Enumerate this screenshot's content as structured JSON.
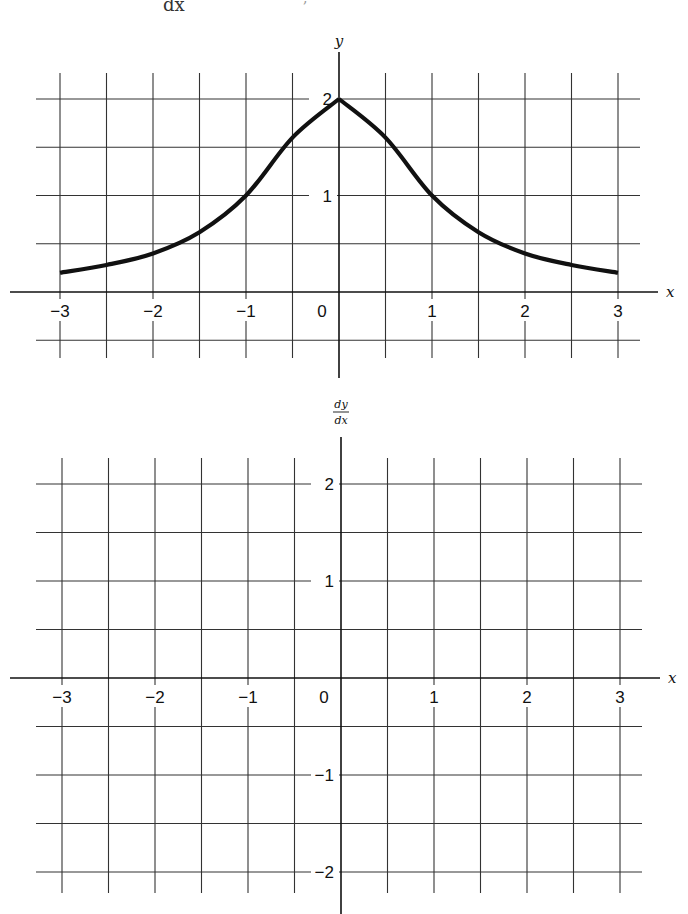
{
  "header": {
    "fragment": "dx",
    "comma": ","
  },
  "chart_data": [
    {
      "type": "line",
      "title": "",
      "function_hint": "y = 2/(1+x^2)",
      "xlabel": "x",
      "ylabel": "y",
      "xlim": [
        -3,
        3
      ],
      "ylim": [
        -0.5,
        2
      ],
      "grid": true,
      "grid_step": 0.5,
      "x_ticks": [
        -3,
        -2,
        -1,
        0,
        1,
        2,
        3
      ],
      "x_tick_labels": [
        "−3",
        "−2",
        "−1",
        "0",
        "1",
        "2",
        "3"
      ],
      "y_ticks": [
        1,
        2
      ],
      "y_tick_labels": [
        "1",
        "2"
      ],
      "series": [
        {
          "name": "y",
          "x": [
            -3,
            -2.5,
            -2,
            -1.5,
            -1,
            -0.5,
            0,
            0.5,
            1,
            1.5,
            2,
            2.5,
            3
          ],
          "y": [
            0.2,
            0.28,
            0.4,
            0.62,
            1.0,
            1.6,
            2.0,
            1.6,
            1.0,
            0.62,
            0.4,
            0.28,
            0.2
          ]
        }
      ]
    },
    {
      "type": "line",
      "title": "",
      "xlabel": "x",
      "ylabel": "dy/dx",
      "ylabel_numerator": "dy",
      "ylabel_denominator": "dx",
      "xlim": [
        -3,
        3
      ],
      "ylim": [
        -2,
        2
      ],
      "grid": true,
      "grid_step": 0.5,
      "x_ticks": [
        -3,
        -2,
        -1,
        0,
        1,
        2,
        3
      ],
      "x_tick_labels": [
        "−3",
        "−2",
        "−1",
        "0",
        "1",
        "2",
        "3"
      ],
      "y_ticks": [
        2,
        1,
        -1,
        -2
      ],
      "y_tick_labels": [
        "2",
        "1",
        "−1",
        "−2"
      ],
      "series": []
    }
  ]
}
